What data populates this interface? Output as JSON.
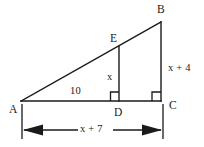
{
  "figure": {
    "type": "right-triangle-with-inscribed-altitude",
    "stroke_color": "#1a1a1a",
    "background_color": "#ffffff",
    "vertices": {
      "A": {
        "label": "A",
        "x": 21,
        "y": 101
      },
      "B": {
        "label": "B",
        "x": 161,
        "y": 22
      },
      "C": {
        "label": "C",
        "x": 161,
        "y": 101
      },
      "D": {
        "label": "D",
        "x": 119,
        "y": 101
      },
      "E": {
        "label": "E",
        "x": 119,
        "y": 46
      }
    },
    "segments": [
      {
        "name": "hypotenuse-AB",
        "from": "A",
        "to": "B"
      },
      {
        "name": "base-AC",
        "from": "A",
        "to": "C"
      },
      {
        "name": "leg-BC",
        "from": "B",
        "to": "C"
      },
      {
        "name": "altitude-ED",
        "from": "E",
        "to": "D"
      }
    ],
    "right_angles": [
      {
        "name": "right-angle-at-D",
        "at": "D"
      },
      {
        "name": "right-angle-at-C",
        "at": "C"
      }
    ],
    "measures": {
      "AD": "10",
      "ED": "x",
      "BC": "x + 4",
      "AC": "x + 7"
    },
    "dimension_line": {
      "name": "overall-base-dimension",
      "label": "x + 7",
      "from_x": 22,
      "to_x": 163,
      "y": 130
    }
  }
}
